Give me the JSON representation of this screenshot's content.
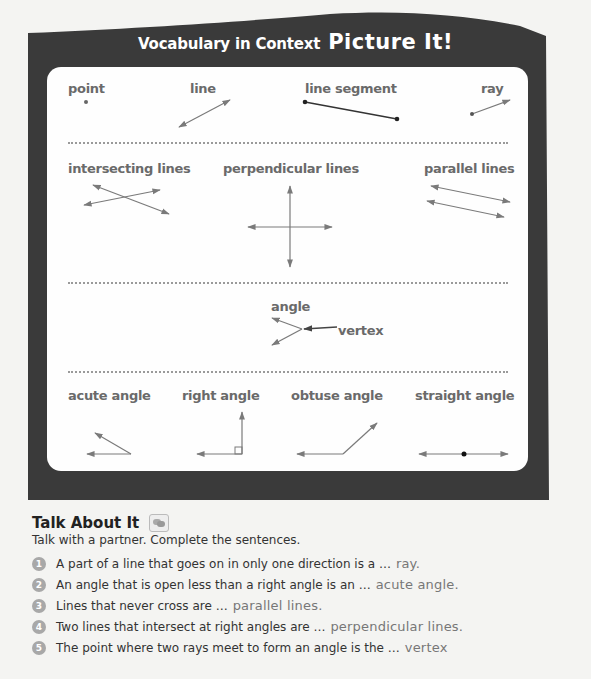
{
  "header": {
    "title_part1": "Vocabulary in Context",
    "title_part2": "Picture It!"
  },
  "terms": {
    "row1": [
      {
        "label": "point",
        "icon": "point-diagram"
      },
      {
        "label": "line",
        "icon": "line-diagram"
      },
      {
        "label": "line segment",
        "icon": "line-segment-diagram"
      },
      {
        "label": "ray",
        "icon": "ray-diagram"
      }
    ],
    "row2": [
      {
        "label": "intersecting lines",
        "icon": "intersecting-lines-diagram"
      },
      {
        "label": "perpendicular lines",
        "icon": "perpendicular-lines-diagram"
      },
      {
        "label": "parallel lines",
        "icon": "parallel-lines-diagram"
      }
    ],
    "row3": [
      {
        "label": "angle",
        "icon": "angle-diagram",
        "annotation": "vertex"
      }
    ],
    "row4": [
      {
        "label": "acute angle",
        "icon": "acute-angle-diagram"
      },
      {
        "label": "right angle",
        "icon": "right-angle-diagram"
      },
      {
        "label": "obtuse angle",
        "icon": "obtuse-angle-diagram"
      },
      {
        "label": "straight angle",
        "icon": "straight-angle-diagram"
      }
    ]
  },
  "talk": {
    "heading": "Talk About It",
    "icon": "speech-bubbles-icon",
    "instructions": "Talk with a partner. Complete the sentences.",
    "items": [
      {
        "num": "1",
        "prompt": "A part of a line that goes on in only one direction is a …",
        "answer": "ray."
      },
      {
        "num": "2",
        "prompt": "An angle that is open less than a right angle is an …",
        "answer": "acute angle."
      },
      {
        "num": "3",
        "prompt": "Lines that never cross are …",
        "answer": "parallel lines."
      },
      {
        "num": "4",
        "prompt": "Two lines that intersect at right angles are …",
        "answer": "perpendicular lines."
      },
      {
        "num": "5",
        "prompt": "The point where two rays meet to form an angle is the …",
        "answer": "vertex"
      }
    ]
  },
  "colors": {
    "frame": "#3c3c3c",
    "panel": "#fefefe",
    "term_text": "#6a6a6a",
    "diagram_line": "#7a7a7a",
    "answer_text": "#777777"
  }
}
